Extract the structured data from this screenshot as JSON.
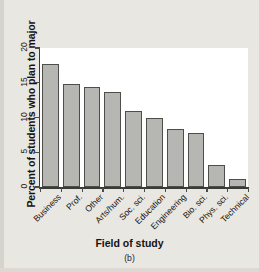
{
  "chart_data": {
    "type": "bar",
    "title": "",
    "xlabel": "Field of study",
    "ylabel": "Percent of students who plan to major",
    "panel_label": "(b)",
    "categories": [
      "Business",
      "Prof.",
      "Other",
      "Arts/hum.",
      "Soc. sci.",
      "Education",
      "Engineering",
      "Bio. sci.",
      "Phys. sci.",
      "Technical"
    ],
    "values": [
      17.7,
      14.8,
      14.4,
      13.7,
      10.9,
      10.0,
      8.4,
      7.8,
      3.1,
      1.2
    ],
    "ylim": [
      0,
      20
    ],
    "yticks": [
      0,
      5,
      10,
      15,
      20
    ],
    "ytick_labels": [
      "0",
      "5",
      "10",
      "15",
      "20"
    ],
    "grid": false,
    "legend": null,
    "bar_fill_color": "#b6b6b2",
    "bar_edge_color": "#4d4d4a",
    "plot_background": "#ffffff",
    "figure_background": "#e9e7e2"
  }
}
